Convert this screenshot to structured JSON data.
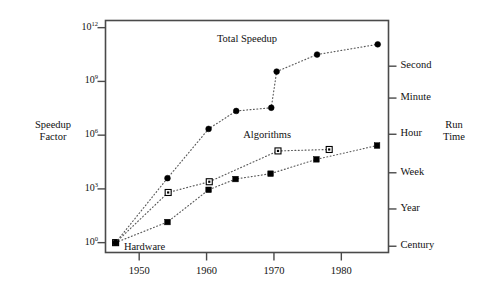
{
  "chart_data": {
    "type": "scatter",
    "title": "",
    "subtitle": "",
    "xlabel": "",
    "ylabel": "Speedup\nFactor",
    "ylabel_line1": "Speedup",
    "ylabel_line2": "Factor",
    "y2label_line1": "Run",
    "y2label_line2": "Time",
    "grid": false,
    "legend_position": "inline-annotations",
    "xlim": [
      1945,
      1987
    ],
    "ylim_log10": [
      -0.55,
      12.4
    ],
    "yscale": "log",
    "xticks": [
      1950,
      1960,
      1970,
      1980
    ],
    "xtick_labels": [
      "1950",
      "1960",
      "1970",
      "1980"
    ],
    "yticks_log10": [
      0,
      3,
      6,
      9,
      12
    ],
    "ytick_labels": [
      "10⁰",
      "10³",
      "10⁶",
      "10⁹",
      "10¹²"
    ],
    "ytick_mantissa": [
      "10",
      "10",
      "10",
      "10",
      "10"
    ],
    "ytick_exponent": [
      "0",
      "3",
      "6",
      "9",
      "12"
    ],
    "right_axis_label": "Run Time",
    "right_ticks": [
      {
        "label": "Second",
        "y_log10": 9.85
      },
      {
        "label": "Minute",
        "y_log10": 8.07
      },
      {
        "label": "Hour",
        "y_log10": 6.05
      },
      {
        "label": "Week",
        "y_log10": 3.9
      },
      {
        "label": "Year",
        "y_log10": 1.88
      },
      {
        "label": "Century",
        "y_log10": -0.2
      }
    ],
    "series": [
      {
        "name": "Hardware",
        "marker": "filled-square",
        "label_x": 1950.8,
        "label_y_log10": -0.3,
        "points": [
          {
            "x": 1946.5,
            "y_log10": 0.0
          },
          {
            "x": 1954.2,
            "y_log10": 1.15
          },
          {
            "x": 1960.3,
            "y_log10": 2.95
          },
          {
            "x": 1964.3,
            "y_log10": 3.55
          },
          {
            "x": 1969.5,
            "y_log10": 3.85
          },
          {
            "x": 1976.3,
            "y_log10": 4.65
          },
          {
            "x": 1985.3,
            "y_log10": 5.42
          }
        ]
      },
      {
        "name": "Algorithms",
        "marker": "open-square",
        "label_x": 1969.0,
        "label_y_log10": 5.95,
        "points": [
          {
            "x": 1946.5,
            "y_log10": 0.0
          },
          {
            "x": 1954.3,
            "y_log10": 2.8
          },
          {
            "x": 1960.4,
            "y_log10": 3.4
          },
          {
            "x": 1970.6,
            "y_log10": 5.12
          },
          {
            "x": 1978.2,
            "y_log10": 5.2
          }
        ]
      },
      {
        "name": "Total Speedup",
        "marker": "filled-circle",
        "label_x": 1966.0,
        "label_y_log10": 11.3,
        "points": [
          {
            "x": 1946.5,
            "y_log10": 0.0
          },
          {
            "x": 1954.2,
            "y_log10": 3.6
          },
          {
            "x": 1960.3,
            "y_log10": 6.35
          },
          {
            "x": 1964.4,
            "y_log10": 7.35
          },
          {
            "x": 1969.6,
            "y_log10": 7.53
          },
          {
            "x": 1970.4,
            "y_log10": 9.55
          },
          {
            "x": 1976.4,
            "y_log10": 10.5
          },
          {
            "x": 1985.4,
            "y_log10": 11.07
          }
        ]
      }
    ],
    "annotations": [
      {
        "text": "Total Speedup",
        "series": "Total Speedup"
      },
      {
        "text": "Algorithms",
        "series": "Algorithms"
      },
      {
        "text": "Hardware",
        "series": "Hardware"
      }
    ]
  },
  "colors": {
    "axis": "#4a4a4a",
    "marker": "#000000",
    "line": "#5a5a5a",
    "text": "#111111",
    "background": "#ffffff"
  }
}
